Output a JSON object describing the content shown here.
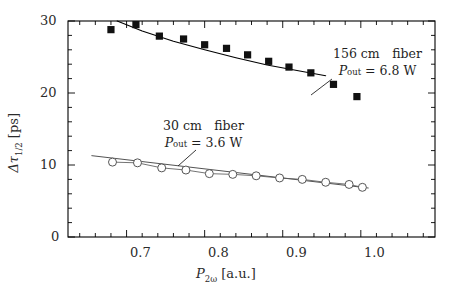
{
  "figure": {
    "background": "#ffffff",
    "frame_color": "#000000",
    "series_square_color": "#111111",
    "series_circle_color": "#555555"
  },
  "axes": {
    "x": {
      "label_main": "P",
      "label_sub": "2ω",
      "label_unit": " [a.u.]",
      "label_full": "P2ω [a.u.]",
      "ticks": [
        "0.7",
        "0.8",
        "0.9",
        "1.0"
      ],
      "tick_values": [
        0.7,
        0.8,
        0.9,
        1.0
      ],
      "range": [
        0.625,
        1.095
      ]
    },
    "y": {
      "label_main": "Δτ",
      "label_sub": "1/2",
      "label_unit": " [ps]",
      "label_full": "Δτ1/2 [ps]",
      "ticks": [
        "0",
        "10",
        "20",
        "30"
      ],
      "tick_values": [
        0,
        10,
        20,
        30
      ],
      "range": [
        0,
        30
      ]
    }
  },
  "annotations": [
    {
      "id": "upper",
      "line1": "156 cm fiber",
      "line2_main": "P",
      "line2_sub": "out",
      "line2_rest": " = 6.8 W",
      "line2_full": "Pout = 6.8 W"
    },
    {
      "id": "lower",
      "line1": "30 cm fiber",
      "line2_main": "P",
      "line2_sub": "out",
      "line2_rest": " = 3.6 W",
      "line2_full": "Pout = 3.6 W"
    }
  ],
  "chart_data": {
    "type": "scatter",
    "title": "",
    "xlabel": "P2ω [a.u.]",
    "ylabel": "Δτ1/2 [ps]",
    "xlim": [
      0.625,
      1.095
    ],
    "ylim": [
      0,
      30
    ],
    "grid": false,
    "legend": "none (inline annotations)",
    "series": [
      {
        "name": "156 cm fiber, Pout = 6.8 W",
        "marker": "filled-square",
        "x": [
          0.68,
          0.712,
          0.742,
          0.773,
          0.8,
          0.828,
          0.855,
          0.882,
          0.908,
          0.936,
          0.965,
          0.995
        ],
        "y": [
          28.8,
          29.5,
          27.9,
          27.5,
          26.7,
          26.2,
          25.3,
          24.4,
          23.6,
          22.8,
          21.2,
          19.5,
          18.3
        ],
        "values": [
          28.8,
          29.5,
          27.9,
          27.5,
          26.7,
          26.2,
          25.3,
          24.4,
          23.6,
          22.8,
          21.2,
          19.5
        ],
        "fit_line": {
          "x": [
            0.688,
            0.72,
            0.76,
            0.8,
            0.84,
            0.88,
            0.92,
            0.955
          ],
          "y": [
            30.0,
            28.6,
            27.2,
            26.0,
            24.9,
            23.9,
            23.1,
            22.4
          ]
        }
      },
      {
        "name": "30 cm fiber, Pout = 3.6 W",
        "marker": "open-circle",
        "x": [
          0.682,
          0.714,
          0.745,
          0.776,
          0.806,
          0.836,
          0.866,
          0.896,
          0.925,
          0.955,
          0.985,
          1.002
        ],
        "y": [
          10.4,
          10.3,
          9.6,
          9.3,
          8.8,
          8.7,
          8.5,
          8.2,
          8.0,
          7.6,
          7.3,
          6.9
        ],
        "values": [
          10.4,
          10.3,
          9.6,
          9.3,
          8.8,
          8.7,
          8.5,
          8.2,
          8.0,
          7.6,
          7.3,
          6.9
        ],
        "fit_line": {
          "x": [
            0.655,
            1.01
          ],
          "y": [
            11.3,
            6.8
          ]
        }
      }
    ]
  }
}
